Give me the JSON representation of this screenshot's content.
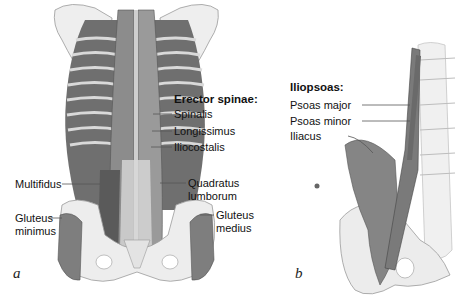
{
  "panels": [
    {
      "letter": "a",
      "title": "Erector spinae:",
      "labels": {
        "spinalis": "Spinalis",
        "longissimus": "Longissimus",
        "iliocostalis": "Iliocostalis",
        "multifidus": "Multifidus",
        "quadratus_1": "Quadratus",
        "quadratus_2": "lumborum",
        "gluteus_minimus_1": "Gluteus",
        "gluteus_minimus_2": "minimus",
        "gluteus_medius_1": "Gluteus",
        "gluteus_medius_2": "medius"
      }
    },
    {
      "letter": "b",
      "title": "Iliopsoas:",
      "labels": {
        "psoas_major": "Psoas major",
        "psoas_minor": "Psoas minor",
        "iliacus": "Iliacus"
      }
    }
  ],
  "colors": {
    "muscle": "#8a8a8a",
    "muscle_dark": "#5e5e5e",
    "bone": "#ececec",
    "bone_edge": "#9a9a9a",
    "leader_line": "#555555"
  }
}
